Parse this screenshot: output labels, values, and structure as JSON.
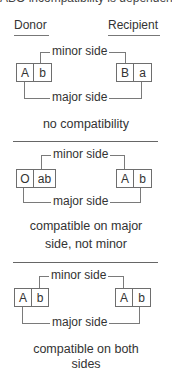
{
  "top_clipped_text": "ABO incompatibility is dependent",
  "headers": {
    "donor": "Donor",
    "recipient": "Recipient"
  },
  "labels": {
    "minor": "minor side",
    "major": "major side"
  },
  "sections": [
    {
      "donor_cells": [
        "A",
        "b"
      ],
      "recipient_cells": [
        "B",
        "a"
      ],
      "caption_lines": [
        "no compatibility"
      ]
    },
    {
      "donor_cells": [
        "O",
        "ab"
      ],
      "recipient_cells": [
        "A",
        "b"
      ],
      "caption_lines": [
        "compatible on major",
        "side, not minor"
      ]
    },
    {
      "donor_cells": [
        "A",
        "b"
      ],
      "recipient_cells": [
        "A",
        "b"
      ],
      "caption_lines": [
        "compatible on both",
        "sides"
      ]
    }
  ],
  "colors": {
    "text": "#333333",
    "lines": "#7a7a7a",
    "background": "#ffffff"
  }
}
